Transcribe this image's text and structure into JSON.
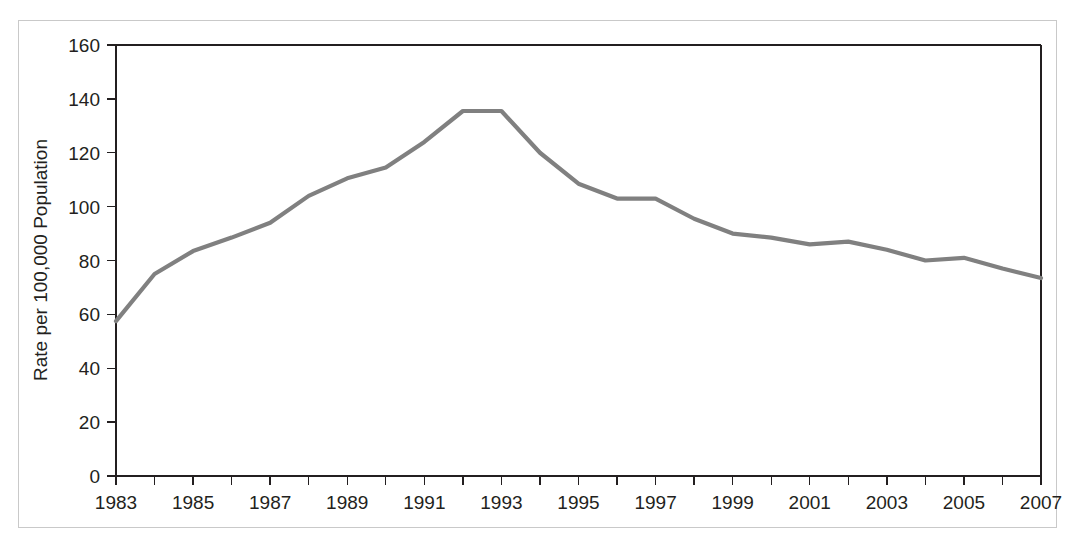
{
  "chart_data": {
    "type": "line",
    "title": "",
    "xlabel": "",
    "ylabel": "Rate per 100,000 Population",
    "xlim": [
      1983,
      2007
    ],
    "ylim": [
      0,
      160
    ],
    "grid": false,
    "legend": "none",
    "line_color": "#808080",
    "axis_color": "#231f20",
    "frame_color": "#c9c9c9",
    "y_ticks": [
      0,
      20,
      40,
      60,
      80,
      100,
      120,
      140,
      160
    ],
    "y_tick_labels": [
      "0",
      "20",
      "40",
      "60",
      "80",
      "100",
      "120",
      "140",
      "160"
    ],
    "x_ticks": [
      1983,
      1984,
      1985,
      1986,
      1987,
      1988,
      1989,
      1990,
      1991,
      1992,
      1993,
      1994,
      1995,
      1996,
      1997,
      1998,
      1999,
      2000,
      2001,
      2002,
      2003,
      2004,
      2005,
      2006,
      2007
    ],
    "x_tick_labels_shown": [
      "1983",
      "1985",
      "1987",
      "1989",
      "1991",
      "1993",
      "1995",
      "1997",
      "1999",
      "2001",
      "2003",
      "2005",
      "2007"
    ],
    "x": [
      1983,
      1984,
      1985,
      1986,
      1987,
      1988,
      1989,
      1990,
      1991,
      1992,
      1993,
      1994,
      1995,
      1996,
      1997,
      1998,
      1999,
      2000,
      2001,
      2002,
      2003,
      2004,
      2005,
      2006,
      2007
    ],
    "values": [
      57.5,
      75.0,
      83.5,
      88.5,
      94.0,
      104.0,
      110.5,
      114.5,
      124.0,
      135.5,
      135.5,
      120.0,
      108.5,
      103.0,
      103.0,
      95.5,
      90.0,
      88.5,
      86.0,
      87.0,
      84.0,
      80.0,
      81.0,
      77.0,
      73.5
    ]
  }
}
